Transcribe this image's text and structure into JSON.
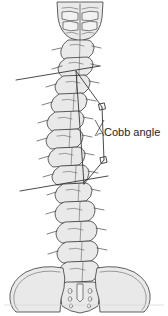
{
  "figure": {
    "background_color": "#ffffff",
    "width": 168,
    "height": 316,
    "bone_fill_color": "#e9e9e9",
    "outline_color": "#3a3a3a",
    "construction_line_color": "#2b2b2b"
  },
  "annotations": {
    "cobb_label": "Cobb angle",
    "cobb_label_position": {
      "x": 104,
      "y": 126
    }
  },
  "anatomy": {
    "regions": [
      {
        "name": "occiput-upper-cervical",
        "label": ""
      },
      {
        "name": "cervical-spine",
        "label": ""
      },
      {
        "name": "thoracic-spine",
        "label": ""
      },
      {
        "name": "lumbar-spine",
        "label": ""
      },
      {
        "name": "sacrum",
        "label": ""
      },
      {
        "name": "pelvis-iliac-wings",
        "label": ""
      }
    ]
  },
  "construction": {
    "upper_endplate_line": {
      "x1": 16,
      "y1": 80,
      "x2": 100,
      "y2": 66
    },
    "lower_endplate_line": {
      "x1": 20,
      "y1": 191,
      "x2": 108,
      "y2": 176
    },
    "upper_perpendicular": {
      "x1": 76,
      "y1": 72,
      "x2": 103,
      "y2": 108
    },
    "lower_perpendicular": {
      "x1": 103,
      "y1": 108,
      "x2": 105,
      "y2": 160
    },
    "right_angle_markers": 2,
    "angle_vertex": {
      "x": 100,
      "y": 130
    },
    "angle_arc_present": true
  }
}
